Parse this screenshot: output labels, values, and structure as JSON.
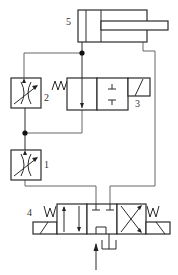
{
  "diagram": {
    "type": "hydraulic-circuit",
    "components": [
      {
        "id": "1",
        "label": "1",
        "kind": "adjustable throttle valve (lower)"
      },
      {
        "id": "2",
        "label": "2",
        "kind": "adjustable throttle valve (upper)"
      },
      {
        "id": "3",
        "label": "3",
        "kind": "2-position solenoid directional valve, spring return"
      },
      {
        "id": "4",
        "label": "4",
        "kind": "3-position 4-way solenoid directional valve, spring centered"
      },
      {
        "id": "5",
        "label": "5",
        "kind": "single-rod double-acting hydraulic cylinder"
      }
    ],
    "colors": {
      "line": "#2a2a2a",
      "background": "#ffffff"
    }
  }
}
